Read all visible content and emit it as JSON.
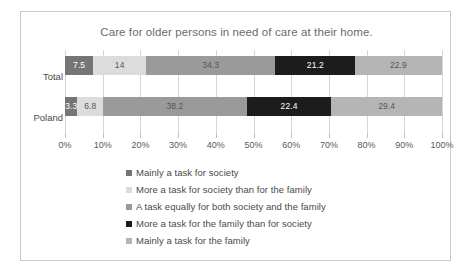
{
  "chart_data": {
    "type": "bar",
    "orientation": "horizontal",
    "stacked": true,
    "normalized_percent": true,
    "title": "Care for older persons in need of care at their home.",
    "xlabel": "",
    "ylabel": "",
    "xlim": [
      0,
      100
    ],
    "grid": true,
    "legend_position": "bottom",
    "categories": [
      "Total",
      "Poland"
    ],
    "tick_labels": [
      "0%",
      "10%",
      "20%",
      "30%",
      "40%",
      "50%",
      "60%",
      "70%",
      "80%",
      "90%",
      "100%"
    ],
    "tick_values": [
      0,
      10,
      20,
      30,
      40,
      50,
      60,
      70,
      80,
      90,
      100
    ],
    "series": [
      {
        "name": "Mainly a task for society",
        "color": "#757575",
        "label_on_dark": true,
        "values": [
          7.5,
          3.3
        ],
        "value_labels": [
          "7.5",
          "3.3"
        ]
      },
      {
        "name": "More a task for society than for the family",
        "color": "#dcdcdc",
        "label_on_dark": false,
        "values": [
          14,
          6.8
        ],
        "value_labels": [
          "14",
          "6.8"
        ]
      },
      {
        "name": "A task equally for both society and the family",
        "color": "#9a9a9a",
        "label_on_dark": false,
        "values": [
          34.3,
          38.2
        ],
        "value_labels": [
          "34.3",
          "38.2"
        ]
      },
      {
        "name": "More a task for the family than for society",
        "color": "#1c1c1c",
        "label_on_dark": true,
        "values": [
          21.2,
          22.4
        ],
        "value_labels": [
          "21.2",
          "22.4"
        ]
      },
      {
        "name": "Mainly a task for the family",
        "color": "#b5b5b5",
        "label_on_dark": false,
        "values": [
          22.9,
          29.4
        ],
        "value_labels": [
          "22.9",
          "29.4"
        ]
      }
    ]
  },
  "colors": {
    "frame_border": "#c9c9c9",
    "gridline": "#d6d6d6",
    "title_text": "#6b6b6b",
    "axis_text": "#5a5a5a",
    "legend_text": "#4a4a4a",
    "background": "#ffffff"
  }
}
